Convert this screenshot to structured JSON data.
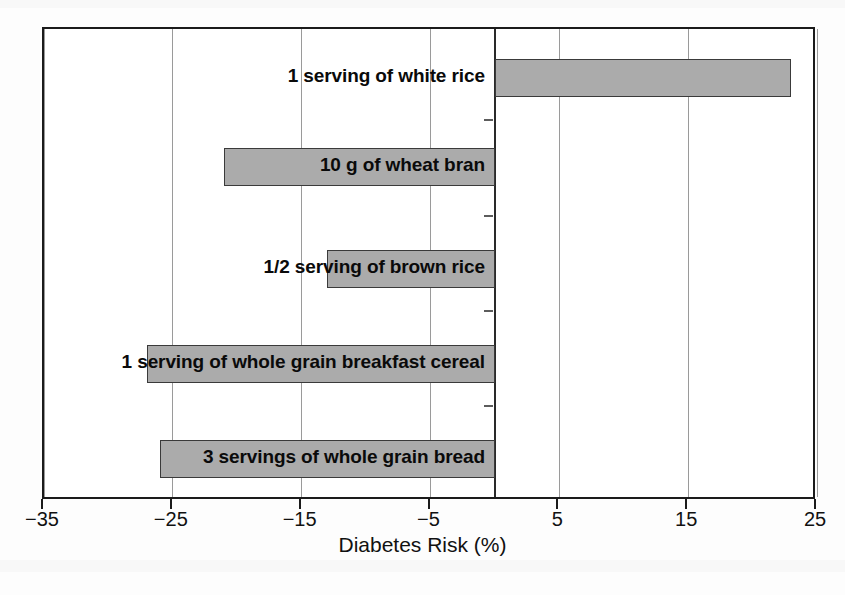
{
  "chart_data": {
    "type": "bar",
    "orientation": "horizontal",
    "title": "",
    "xlabel": "Diabetes Risk (%)",
    "ylabel": "",
    "xlim": [
      -35,
      25
    ],
    "xticks": [
      -35,
      -25,
      -15,
      -5,
      5,
      15,
      25
    ],
    "xtick_labels": [
      "−35",
      "−25",
      "−15",
      "−5",
      "5",
      "15",
      "25"
    ],
    "grid": true,
    "grid_axis": "x",
    "legend": "none",
    "zero_reference": 0,
    "categories": [
      "1 serving of white rice",
      "10 g of wheat bran",
      "1/2 serving of brown rice",
      "1 serving of whole grain breakfast cereal",
      "3 servings of whole grain bread"
    ],
    "values": [
      23,
      -21,
      -13,
      -27,
      -26
    ],
    "bar_color": "#ababab",
    "bar_edge_color": "#3a3a3a"
  },
  "axis": {
    "x_title": "Diabetes Risk (%)",
    "ticks": [
      {
        "value": -35,
        "label": "−35"
      },
      {
        "value": -25,
        "label": "−25"
      },
      {
        "value": -15,
        "label": "−15"
      },
      {
        "value": -5,
        "label": "−5"
      },
      {
        "value": 5,
        "label": "5"
      },
      {
        "value": 15,
        "label": "15"
      },
      {
        "value": 25,
        "label": "25"
      }
    ]
  },
  "bars": [
    {
      "label": "1 serving of white rice",
      "value": 23
    },
    {
      "label": "10 g of wheat bran",
      "value": -21
    },
    {
      "label": "1/2 serving of brown rice",
      "value": -13
    },
    {
      "label": "1 serving of whole grain breakfast cereal",
      "value": -27
    },
    {
      "label": "3 servings of whole grain bread",
      "value": -26
    }
  ],
  "colors": {
    "bar_fill": "#ababab",
    "bar_stroke": "#3a3a3a",
    "frame": "#1b1b1b",
    "grid": "#9a9a9a",
    "text": "#111111",
    "background": "#ffffff"
  }
}
